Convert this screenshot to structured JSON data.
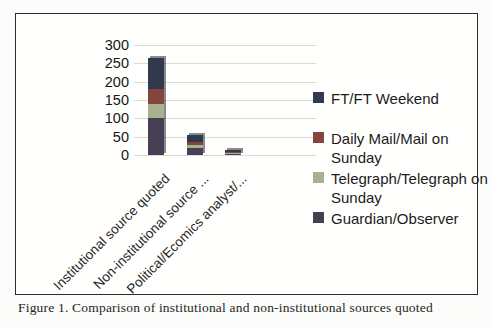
{
  "figure": {
    "caption": "Figure 1. Comparison of institutional and non-institutional sources quoted"
  },
  "chart_data": {
    "type": "bar",
    "stacked": true,
    "title": "",
    "xlabel": "",
    "ylabel": "",
    "categories": [
      "Institutional source quoted",
      "Non-institutional source ...",
      "Political/Ecomics analyst/..."
    ],
    "series": [
      {
        "name": "FT/FT Weekend",
        "color": "#30394d",
        "values": [
          85,
          20,
          4
        ]
      },
      {
        "name": "Daily Mail/Mail on Sunday",
        "color": "#84453f",
        "values": [
          40,
          8,
          3
        ]
      },
      {
        "name": "Telegraph/Telegraph on Sunday",
        "color": "#a8b28e",
        "values": [
          40,
          8,
          2
        ]
      },
      {
        "name": "Guardian/Observer",
        "color": "#474055",
        "values": [
          100,
          19,
          4
        ]
      }
    ],
    "stack_order_bottom_to_top": [
      "Guardian/Observer",
      "Telegraph/Telegraph on Sunday",
      "Daily Mail/Mail on Sunday",
      "FT/FT Weekend"
    ],
    "totals_by_category": [
      265,
      55,
      13
    ],
    "ylim": [
      0,
      300
    ],
    "yticks": [
      0,
      50,
      100,
      150,
      200,
      250,
      300
    ],
    "grid": true,
    "legend_position": "right"
  }
}
